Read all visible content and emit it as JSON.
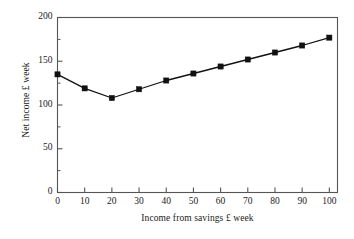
{
  "chart_data": {
    "type": "line",
    "title": "",
    "xlabel": "Income from savings £ week",
    "ylabel": "Net income £ week",
    "x": [
      0,
      10,
      20,
      30,
      40,
      50,
      60,
      70,
      80,
      90,
      100
    ],
    "values": [
      135,
      119,
      108,
      118,
      128,
      136,
      144,
      152,
      160,
      168,
      177
    ],
    "series": [
      {
        "name": "Net income",
        "values": [
          135,
          119,
          108,
          118,
          128,
          136,
          144,
          152,
          160,
          168,
          177
        ]
      }
    ],
    "xlim": [
      0,
      103
    ],
    "ylim": [
      0,
      200
    ],
    "xticks": [
      0,
      10,
      20,
      30,
      40,
      50,
      60,
      70,
      80,
      90,
      100
    ],
    "xtick_labels": [
      "0",
      "10",
      "20",
      "30",
      "40",
      "50",
      "60",
      "70",
      "80",
      "90",
      "100"
    ],
    "yticks": [
      0,
      50,
      100,
      150,
      200
    ],
    "ytick_labels": [
      "0",
      "50",
      "100",
      "150",
      "200"
    ],
    "yminor_ticks": [
      25,
      75,
      125,
      175
    ],
    "grid": false,
    "legend": null,
    "marker": "square",
    "line_color": "#111111",
    "marker_color": "#111111",
    "axis_color": "#555555",
    "background": "#ffffff"
  }
}
